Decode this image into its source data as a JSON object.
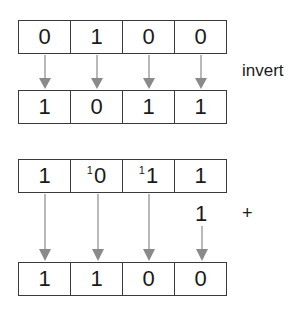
{
  "diagram": {
    "rows": [
      {
        "id": "original",
        "bits": [
          "0",
          "1",
          "0",
          "0"
        ],
        "carries": [
          "",
          "",
          "",
          ""
        ]
      },
      {
        "id": "inverted",
        "bits": [
          "1",
          "0",
          "1",
          "1"
        ],
        "carries": [
          "",
          "",
          "",
          ""
        ]
      },
      {
        "id": "addend",
        "bits": [
          "1",
          "0",
          "1",
          "1"
        ],
        "carries": [
          "",
          "1",
          "1",
          ""
        ]
      },
      {
        "id": "result",
        "bits": [
          "1",
          "1",
          "0",
          "0"
        ],
        "carries": [
          "",
          "",
          "",
          ""
        ]
      }
    ],
    "invert_label": "invert",
    "add_one_value": "1",
    "plus_sign": "+",
    "arrow_color": "#8a8a8a",
    "box_border_color": "#3a3a3a"
  }
}
